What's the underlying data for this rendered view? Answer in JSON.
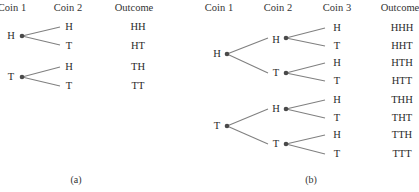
{
  "figure_a": {
    "caption": "(a)",
    "headers": {
      "coin1": "Coin 1",
      "coin2": "Coin 2",
      "outcome": "Outcome"
    },
    "coin1_nodes": [
      "H",
      "T"
    ],
    "coin2_leaves": [
      "H",
      "T",
      "H",
      "T"
    ],
    "outcomes": [
      "HH",
      "HT",
      "TH",
      "TT"
    ]
  },
  "figure_b": {
    "caption": "(b)",
    "headers": {
      "coin1": "Coin 1",
      "coin2": "Coin 2",
      "coin3": "Coin 3",
      "outcome": "Outcome"
    },
    "coin1_nodes": [
      "H",
      "T"
    ],
    "coin2_nodes": [
      "H",
      "T",
      "H",
      "T"
    ],
    "coin3_leaves": [
      "H",
      "T",
      "H",
      "T",
      "H",
      "T",
      "H",
      "T"
    ],
    "outcomes": [
      "HHH",
      "HHT",
      "HTH",
      "HTT",
      "THH",
      "THT",
      "TTH",
      "TTT"
    ]
  },
  "colors": {
    "node": "#4a4a4a",
    "branch": "#808080",
    "text": "#2a2a2a"
  }
}
